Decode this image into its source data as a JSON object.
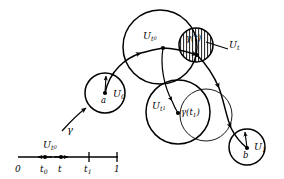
{
  "figure": {
    "kind": "mathematical-diagram",
    "background_color": "#ffffff",
    "stroke_color": "#000000",
    "size": {
      "width": 284,
      "height": 179
    }
  },
  "number_line": {
    "name": "unit-interval",
    "axis_start_label": "0",
    "axis_end_label": "1",
    "ticks": [
      {
        "id": "zero",
        "label": "0",
        "x": 18
      },
      {
        "id": "t0",
        "label": "t",
        "sub": "0",
        "x": 45
      },
      {
        "id": "t",
        "label": "t",
        "sub": "",
        "x": 61
      },
      {
        "id": "t1",
        "label": "t",
        "sub": "1",
        "x": 89
      },
      {
        "id": "one",
        "label": "1",
        "x": 117
      }
    ],
    "interval_label": {
      "base": "U",
      "sub": "t",
      "subsub": "0",
      "text": "Ut0"
    },
    "dots": [
      {
        "id": "dot-t0",
        "x": 45
      },
      {
        "id": "dot-t",
        "x": 61
      }
    ]
  },
  "labels": {
    "gamma": "γ",
    "gamma_of_t": {
      "base": "γ(t)",
      "text": "γ(t)"
    },
    "gamma_of_t1": {
      "base": "γ(t",
      "sub": "1",
      "close": ")",
      "text": "γ(t1)"
    },
    "U_0": {
      "base": "U",
      "sub": "0",
      "text": "U0"
    },
    "U_1": {
      "base": "U",
      "sub": "1",
      "text": "U1"
    },
    "U_t": {
      "base": "U",
      "sub": "t",
      "text": "Ut"
    },
    "U_t0": {
      "base": "U",
      "sub": "t",
      "subsub": "0",
      "text": "Ut0"
    },
    "U_t1": {
      "base": "U",
      "sub": "t",
      "subsub": "1",
      "text": "Ut1"
    },
    "point_a": "a",
    "point_b": "b"
  },
  "circles": [
    {
      "name": "circle-U0",
      "cx": 105,
      "cy": 93,
      "r": 20,
      "stroke_width": 1.4,
      "fill": "none"
    },
    {
      "name": "circle-Ut0",
      "cx": 160,
      "cy": 47,
      "r": 37,
      "stroke_width": 1.4,
      "fill": "none"
    },
    {
      "name": "circle-Ut",
      "cx": 196,
      "cy": 45,
      "r": 17,
      "stroke_width": 1.4,
      "fill": "hatch"
    },
    {
      "name": "circle-Ut1",
      "cx": 178,
      "cy": 112,
      "r": 32,
      "stroke_width": 1.4,
      "fill": "none"
    },
    {
      "name": "circle-gt1",
      "cx": 206,
      "cy": 115,
      "r": 26,
      "stroke_width": 0.9,
      "fill": "none"
    },
    {
      "name": "circle-U1",
      "cx": 247,
      "cy": 147,
      "r": 18,
      "stroke_width": 1.4,
      "fill": "none"
    }
  ],
  "points": [
    {
      "name": "point-a",
      "cx": 105,
      "cy": 93,
      "r": 1.9
    },
    {
      "name": "point-b",
      "cx": 247,
      "cy": 148,
      "r": 1.9
    },
    {
      "name": "point-gamma-t0",
      "cx": 163,
      "cy": 48,
      "r": 1.9
    },
    {
      "name": "point-gamma-t",
      "cx": 197,
      "cy": 55,
      "r": 1.9
    },
    {
      "name": "point-gamma-t1",
      "cx": 178,
      "cy": 113,
      "r": 1.9
    }
  ]
}
